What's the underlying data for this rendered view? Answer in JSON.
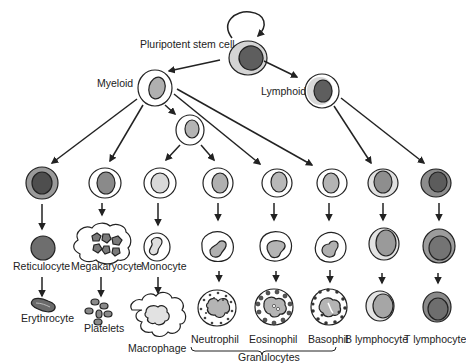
{
  "diagram": {
    "colors": {
      "outline": "#222222",
      "nucleus_dark": "#5a5a5a",
      "nucleus_mid": "#8c8c8c",
      "nucleus_light": "#b4b4b4",
      "nucleus_pale": "#d6d6d6",
      "cytoplasm_light": "#ffffff",
      "cytoplasm_gray": "#cfcfcf",
      "granule": "#555555"
    },
    "labels": {
      "stem": "Pluripotent stem cell",
      "myeloid": "Myeloid",
      "lymphoid": "Lymphoid",
      "reticulocyte": "Reticulocyte",
      "erythrocyte": "Erythrocyte",
      "megakaryocyte": "Megakaryocyte",
      "platelets": "Platelets",
      "monocyte": "Monocyte",
      "macrophage": "Macrophage",
      "neutrophil": "Neutrophil",
      "eosinophil": "Eosinophil",
      "basophil": "Basophil",
      "b_lymphocyte": "B lymphocyte",
      "t_lymphocyte": "T lymphocyte",
      "granulocytes": "Granulocytes"
    },
    "nodes": [
      {
        "id": "stem",
        "label_key": "stem",
        "children": [
          "myeloid",
          "lymphoid",
          "stem"
        ]
      },
      {
        "id": "myeloid",
        "label_key": "myeloid",
        "children": [
          "erythroid_precursor",
          "megakaryocyte_precursor",
          "myeloid_progenitor",
          "eosinophil_precursor",
          "basophil_precursor"
        ]
      },
      {
        "id": "myeloid_progenitor",
        "children": [
          "monocyte_precursor",
          "neutrophil_precursor"
        ]
      },
      {
        "id": "lymphoid",
        "label_key": "lymphoid",
        "children": [
          "b_precursor",
          "t_precursor"
        ]
      },
      {
        "id": "erythroid_precursor",
        "children": [
          "reticulocyte"
        ]
      },
      {
        "id": "reticulocyte",
        "label_key": "reticulocyte",
        "children": [
          "erythrocyte"
        ]
      },
      {
        "id": "megakaryocyte_precursor",
        "children": [
          "megakaryocyte"
        ]
      },
      {
        "id": "megakaryocyte",
        "label_key": "megakaryocyte",
        "children": [
          "platelets"
        ]
      },
      {
        "id": "monocyte_precursor",
        "children": [
          "monocyte"
        ]
      },
      {
        "id": "monocyte",
        "label_key": "monocyte",
        "children": [
          "macrophage"
        ]
      },
      {
        "id": "neutrophil_precursor",
        "children": [
          "neutrophil_band"
        ]
      },
      {
        "id": "neutrophil_band",
        "children": [
          "neutrophil"
        ]
      },
      {
        "id": "eosinophil_precursor",
        "children": [
          "eosinophil_band"
        ]
      },
      {
        "id": "eosinophil_band",
        "children": [
          "eosinophil"
        ]
      },
      {
        "id": "basophil_precursor",
        "children": [
          "basophil_band"
        ]
      },
      {
        "id": "basophil_band",
        "children": [
          "basophil"
        ]
      },
      {
        "id": "b_precursor",
        "children": [
          "b_intermediate"
        ]
      },
      {
        "id": "b_intermediate",
        "children": [
          "b_lymphocyte"
        ]
      },
      {
        "id": "t_precursor",
        "children": [
          "t_intermediate"
        ]
      },
      {
        "id": "t_intermediate",
        "children": [
          "t_lymphocyte"
        ]
      }
    ],
    "groups": [
      {
        "label_key": "granulocytes",
        "members": [
          "neutrophil",
          "eosinophil",
          "basophil"
        ]
      }
    ]
  }
}
